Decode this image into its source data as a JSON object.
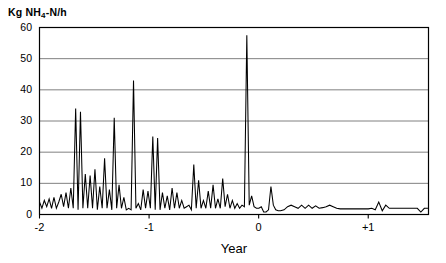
{
  "chart_data": {
    "type": "line",
    "title": "",
    "ylabel": "Kg NH4-N/h",
    "ylabel_rich": {
      "prefix": "Kg NH",
      "sub": "4",
      "suffix": "-N/h"
    },
    "xlabel": "Year",
    "xlim": [
      -2.0,
      1.55
    ],
    "ylim": [
      0,
      60
    ],
    "yticks": [
      0,
      10,
      20,
      30,
      40,
      50,
      60
    ],
    "ytick_labels": [
      "0",
      "10",
      "20",
      "30",
      "40",
      "50",
      "60"
    ],
    "xticks": [
      -2,
      -1,
      0,
      1
    ],
    "xtick_labels": [
      "-2",
      "-1",
      "0",
      "+1"
    ],
    "grid": "horizontal",
    "grid_color": "#808080",
    "line_color": "#000000",
    "axis_color": "#000000",
    "background": "#ffffff",
    "legend": "none",
    "series": [
      {
        "name": "NH4-N load",
        "x": [
          -2.0,
          -1.978,
          -1.956,
          -1.934,
          -1.912,
          -1.89,
          -1.868,
          -1.846,
          -1.824,
          -1.802,
          -1.78,
          -1.758,
          -1.736,
          -1.714,
          -1.692,
          -1.67,
          -1.648,
          -1.626,
          -1.604,
          -1.582,
          -1.56,
          -1.538,
          -1.516,
          -1.494,
          -1.472,
          -1.45,
          -1.428,
          -1.406,
          -1.384,
          -1.362,
          -1.34,
          -1.318,
          -1.296,
          -1.274,
          -1.252,
          -1.23,
          -1.208,
          -1.186,
          -1.164,
          -1.142,
          -1.12,
          -1.098,
          -1.076,
          -1.054,
          -1.032,
          -1.01,
          -0.988,
          -0.966,
          -0.944,
          -0.922,
          -0.9,
          -0.878,
          -0.856,
          -0.834,
          -0.812,
          -0.79,
          -0.768,
          -0.746,
          -0.724,
          -0.702,
          -0.68,
          -0.658,
          -0.636,
          -0.614,
          -0.592,
          -0.57,
          -0.548,
          -0.526,
          -0.504,
          -0.482,
          -0.46,
          -0.438,
          -0.416,
          -0.394,
          -0.372,
          -0.35,
          -0.328,
          -0.306,
          -0.284,
          -0.262,
          -0.24,
          -0.218,
          -0.196,
          -0.174,
          -0.152,
          -0.13,
          -0.108,
          -0.086,
          -0.064,
          -0.042,
          -0.02,
          0.002,
          0.024,
          0.046,
          0.068,
          0.09,
          0.112,
          0.134,
          0.156,
          0.178,
          0.2,
          0.232,
          0.264,
          0.296,
          0.328,
          0.36,
          0.392,
          0.424,
          0.456,
          0.488,
          0.52,
          0.552,
          0.584,
          0.616,
          0.648,
          0.68,
          0.712,
          0.744,
          0.776,
          0.808,
          0.84,
          0.872,
          0.904,
          0.936,
          0.968,
          1.0,
          1.032,
          1.064,
          1.096,
          1.128,
          1.16,
          1.192,
          1.224,
          1.256,
          1.288,
          1.32,
          1.352,
          1.384,
          1.416,
          1.448,
          1.48,
          1.512,
          1.545
        ],
        "y": [
          4.0,
          2.0,
          4.5,
          2.5,
          5.0,
          2.0,
          5.5,
          2.0,
          4.0,
          6.5,
          2.5,
          7.0,
          2.0,
          8.5,
          2.0,
          34.0,
          1.5,
          33.0,
          2.0,
          13.0,
          2.0,
          12.5,
          2.0,
          14.5,
          1.5,
          9.0,
          2.0,
          18.0,
          2.0,
          8.0,
          1.5,
          31.0,
          2.0,
          9.5,
          2.0,
          5.5,
          1.5,
          2.0,
          1.5,
          43.0,
          2.0,
          3.5,
          1.5,
          8.0,
          2.0,
          7.5,
          2.0,
          25.0,
          1.5,
          24.5,
          1.5,
          7.0,
          2.0,
          6.0,
          1.5,
          8.5,
          2.0,
          7.0,
          2.0,
          4.5,
          2.0,
          2.5,
          3.0,
          1.5,
          16.0,
          2.0,
          11.0,
          2.0,
          4.5,
          2.0,
          7.5,
          2.0,
          9.5,
          2.0,
          5.0,
          2.0,
          11.5,
          2.5,
          6.5,
          2.0,
          4.5,
          2.0,
          3.5,
          2.0,
          3.0,
          2.5,
          57.5,
          3.0,
          6.0,
          2.5,
          2.0,
          2.0,
          2.5,
          0.8,
          0.8,
          1.5,
          9.0,
          3.0,
          1.5,
          1.2,
          1.2,
          1.5,
          2.5,
          3.0,
          2.5,
          2.0,
          3.0,
          2.0,
          3.0,
          2.0,
          2.8,
          2.0,
          2.2,
          2.5,
          3.0,
          2.5,
          2.0,
          1.8,
          1.8,
          1.8,
          1.8,
          1.8,
          1.8,
          1.8,
          1.8,
          1.8,
          2.0,
          1.5,
          4.0,
          1.2,
          3.0,
          2.0,
          2.0,
          2.0,
          2.0,
          2.0,
          2.0,
          2.0,
          2.0,
          2.0,
          0.8,
          2.0,
          2.0
        ]
      }
    ]
  },
  "axis_title": {
    "y": "Kg NH4-N/h",
    "x": "Year"
  }
}
